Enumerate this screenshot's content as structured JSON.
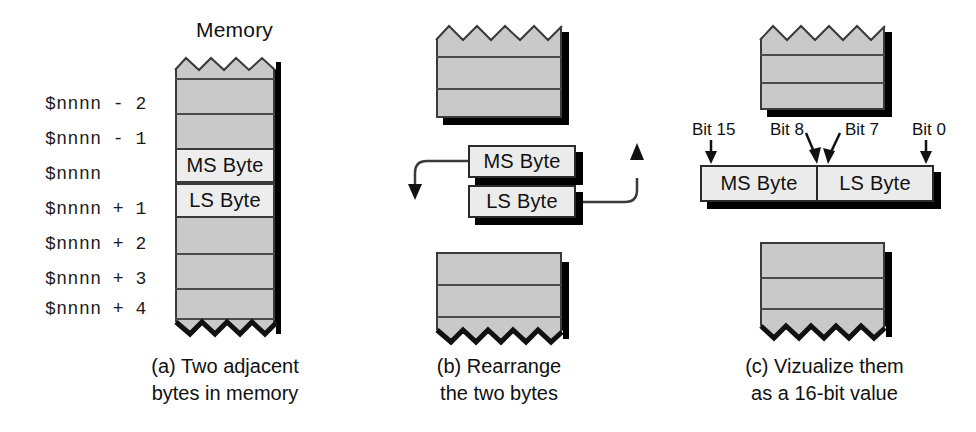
{
  "figure": {
    "title_text": "Memory",
    "panels": [
      {
        "id": "a",
        "caption_line1": "(a) Two adjacent",
        "caption_line2": "bytes in memory",
        "column_header": "Memory",
        "addresses": [
          "$nnnn - 2",
          "$nnnn - 1",
          "$nnnn",
          "$nnnn + 1",
          "$nnnn + 2",
          "$nnnn + 3",
          "$nnnn + 4"
        ],
        "highlighted_cells": [
          {
            "address": "$nnnn",
            "label": "MS Byte"
          },
          {
            "address": "$nnnn + 1",
            "label": "LS Byte"
          }
        ]
      },
      {
        "id": "b",
        "caption_line1": "(b) Rearrange",
        "caption_line2": "the two bytes",
        "boxes": [
          {
            "label": "MS Byte"
          },
          {
            "label": "LS Byte"
          }
        ]
      },
      {
        "id": "c",
        "caption_line1": "(c) Vizualize them",
        "caption_line2": "as a 16-bit value",
        "bit_labels": [
          "Bit 15",
          "Bit 8",
          "Bit 7",
          "Bit 0"
        ],
        "word_halves": [
          {
            "label": "MS Byte"
          },
          {
            "label": "LS Byte"
          }
        ]
      }
    ]
  },
  "colors": {
    "memory_fill": "#c9c9c9",
    "cell_fill": "#ededed",
    "outline": "#2a2a2a",
    "shadow": "#000000",
    "text": "#111111",
    "background": "#ffffff"
  }
}
